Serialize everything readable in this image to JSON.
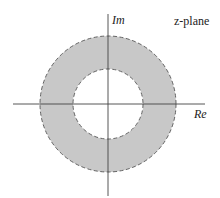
{
  "diagram": {
    "plane_label": "z-plane",
    "real_axis_label": "Re",
    "imag_axis_label": "Im",
    "region": "annulus (ring) between inner and outer dashed circles, shaded",
    "colors": {
      "region_fill": "#c8c8c8",
      "circle_stroke": "#555555",
      "axis": "#444444",
      "background": "#ffffff"
    }
  }
}
